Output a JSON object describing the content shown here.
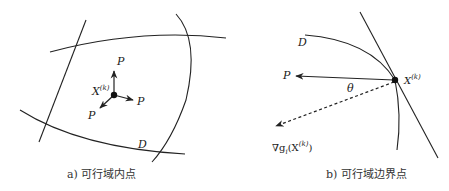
{
  "panel_a": {
    "point_label": "X",
    "point_superscript": "(k)",
    "direction_labels": [
      "P",
      "P",
      "P"
    ],
    "region_label": "D",
    "caption": "a) 可行域内点"
  },
  "panel_b": {
    "point_label": "X",
    "point_superscript": "(k)",
    "direction_label": "P",
    "angle_label": "θ",
    "region_label": "D",
    "gradient_label_prefix": "∇g",
    "gradient_label_subscript": "i",
    "gradient_label_arg": "(X",
    "gradient_label_sup": "(k)",
    "gradient_label_close": ")",
    "caption": "b) 可行域边界点"
  },
  "colors": {
    "stroke": "#222222",
    "background": "#ffffff"
  }
}
